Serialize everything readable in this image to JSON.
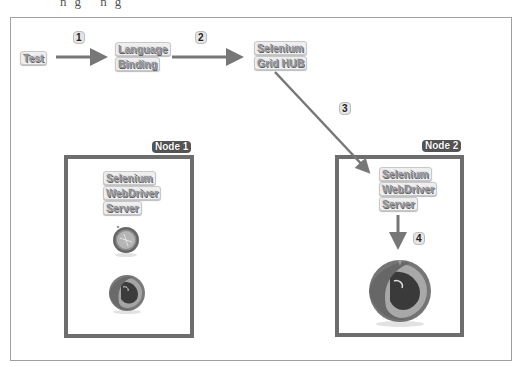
{
  "diagram": {
    "top_fragment": "ng ng",
    "nodes": {
      "test": {
        "label": "Test"
      },
      "language_binding": {
        "lines": [
          "Language",
          "Binding"
        ]
      },
      "grid_hub": {
        "lines": [
          "Selenium",
          "Grid HUB"
        ]
      },
      "node1": {
        "title": "Node 1",
        "server_lines": [
          "Selenium",
          "WebDriver",
          "Server"
        ],
        "browsers": [
          "safari-icon",
          "firefox-icon"
        ]
      },
      "node2": {
        "title": "Node 2",
        "server_lines": [
          "Selenium",
          "WebDriver",
          "Server"
        ],
        "browsers": [
          "firefox-icon"
        ]
      }
    },
    "steps": [
      {
        "number": "1",
        "from": "Test",
        "to": "Language Binding"
      },
      {
        "number": "2",
        "from": "Language Binding",
        "to": "Selenium Grid HUB"
      },
      {
        "number": "3",
        "from": "Selenium Grid HUB",
        "to": "Node 2 Selenium WebDriver Server"
      },
      {
        "number": "4",
        "from": "Node 2 Selenium WebDriver Server",
        "to": "Firefox"
      }
    ],
    "colors": {
      "arrow": "#777777",
      "node_border": "#6d6d6d",
      "frame": "#a0a0a0"
    }
  }
}
